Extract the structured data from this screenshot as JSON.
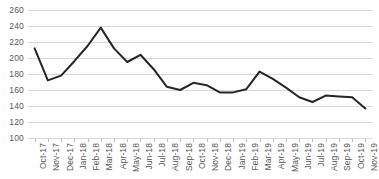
{
  "chart_data": {
    "type": "line",
    "title": "",
    "subtitle": "",
    "xlabel": "",
    "ylabel": "",
    "legend": [],
    "legend_position": "none",
    "grid": true,
    "grid_axis": "y",
    "ylim": [
      100,
      260
    ],
    "ytick_step": 20,
    "yticks": [
      100,
      120,
      140,
      160,
      180,
      200,
      220,
      240,
      260
    ],
    "ytick_labels": [
      "100",
      "120",
      "140",
      "160",
      "180",
      "200",
      "220",
      "240",
      "260"
    ],
    "categories": [
      "Oct-17",
      "Nov-17",
      "Dec-17",
      "Jan-18",
      "Feb-18",
      "Mar-18",
      "Apr-18",
      "May-18",
      "Jun-18",
      "Jul-18",
      "Aug-18",
      "Sep-18",
      "Oct-18",
      "Nov-18",
      "Dec-18",
      "Jan-19",
      "Feb-19",
      "Mar-19",
      "Apr-19",
      "May-19",
      "Jun-19",
      "Jul-19",
      "Aug-19",
      "Sep-19",
      "Oct-19",
      "Nov-19"
    ],
    "series": [
      {
        "name": "",
        "color": "#262626",
        "line_width": 2,
        "markers": false,
        "values": [
          212,
          172,
          178,
          196,
          215,
          238,
          212,
          195,
          204,
          186,
          164,
          160,
          169,
          166,
          157,
          157,
          161,
          183,
          174,
          163,
          151,
          145,
          153,
          152,
          151,
          137
        ]
      }
    ]
  },
  "style": {
    "background": "#ffffff",
    "gridline_color": "#d9d9d9",
    "tick_label_color": "#595959",
    "line_color": "#262626"
  }
}
